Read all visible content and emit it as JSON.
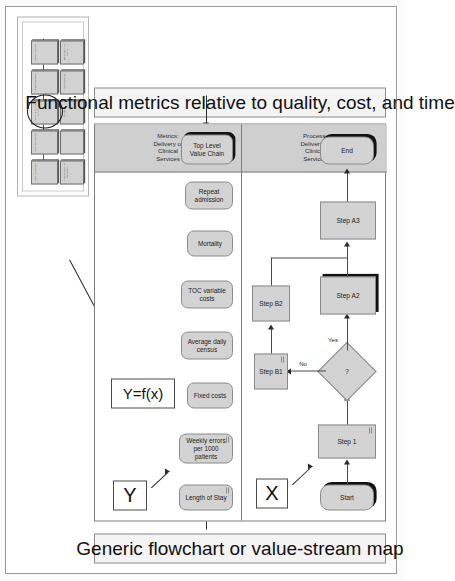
{
  "document": {
    "title": "Functional metrics relative to quality, cost, and time",
    "subtitle": "Generic flowchart or value-stream map"
  },
  "captions": {
    "metrics_caption": "Functional metrics relative to quality, cost, and time",
    "process_caption": "Generic flowchart or value-stream map"
  },
  "markers": {
    "y": "Y",
    "x": "X",
    "relation": "Y=f(x)"
  },
  "lanes": [
    {
      "id": "metrics",
      "label": "Metrics:\nDelivery of\nClinical\nServices",
      "label_lines": [
        "Metrics:",
        "Delivery of",
        "Clinical",
        "Services"
      ]
    },
    {
      "id": "process",
      "label": "Process:\nDelivery of\nClinical\nServices",
      "label_lines": [
        "Process:",
        "Delivery of",
        "Clinical",
        "Services"
      ]
    }
  ],
  "metrics": [
    {
      "id": "length-of-stay",
      "lines": [
        "Length of Stay"
      ],
      "shadow": false,
      "mark": true
    },
    {
      "id": "weekly-errors",
      "lines": [
        "Weekly errors",
        "per 1000",
        "patients"
      ],
      "shadow": false,
      "mark": true
    },
    {
      "id": "fixed-costs",
      "lines": [
        "Fixed costs"
      ],
      "shadow": false,
      "mark": false
    },
    {
      "id": "average-daily-census",
      "lines": [
        "Average daily",
        "census"
      ],
      "shadow": false,
      "mark": false
    },
    {
      "id": "toc-variable-costs",
      "lines": [
        "TOC variable",
        "costs"
      ],
      "shadow": false,
      "mark": false
    },
    {
      "id": "mortality",
      "lines": [
        "Mortality"
      ],
      "shadow": false,
      "mark": false
    },
    {
      "id": "repeat-admission",
      "lines": [
        "Repeat",
        "admission"
      ],
      "shadow": false,
      "mark": false
    },
    {
      "id": "top-level-value-chain",
      "lines": [
        "Top Level",
        "Value Chain"
      ],
      "shadow": true,
      "mark": false
    }
  ],
  "flow": {
    "nodes": [
      {
        "id": "start",
        "label": "Start",
        "shape": "terminator",
        "shadow": true
      },
      {
        "id": "step-1",
        "label": "Step 1",
        "shape": "process",
        "shadow": false
      },
      {
        "id": "decision",
        "label": "?",
        "shape": "decision",
        "shadow": false
      },
      {
        "id": "step-b1",
        "label": "Step B1",
        "shape": "process",
        "shadow": false
      },
      {
        "id": "step-b2",
        "label": "Step B2",
        "shape": "process",
        "shadow": false
      },
      {
        "id": "step-a2",
        "label": "Step A2",
        "shape": "process",
        "shadow": true
      },
      {
        "id": "step-a3",
        "label": "Step A3",
        "shape": "process",
        "shadow": false
      },
      {
        "id": "end",
        "label": "End",
        "shape": "terminator",
        "shadow": true
      }
    ],
    "edge_labels": {
      "no": "No",
      "yes": "Yes"
    }
  },
  "inset": {
    "name": "Top level value chain thumbnail",
    "highlighted_node": "Delivery of Clinical Services",
    "top_row": [
      {
        "id": "t1",
        "text": "View of the Customer"
      },
      {
        "id": "t2",
        "text": "Select and Develop"
      },
      {
        "id": "t3",
        "text": "Delivery of Clinical Services"
      },
      {
        "id": "t4",
        "text": "Manage and Collect"
      },
      {
        "id": "t5",
        "text": "Assess Financials"
      }
    ],
    "bottom_row": [
      {
        "id": "b1",
        "text": "Financial Reporting and Analysis"
      },
      {
        "id": "b2",
        "text": ""
      },
      {
        "id": "b3",
        "text": "Purchasing"
      },
      {
        "id": "b4",
        "text": "Human Resources"
      },
      {
        "id": "b5",
        "text": "Talent Acquisition Control"
      }
    ]
  },
  "colors": {
    "shape_fill": "#d3d3d3",
    "shape_stroke": "#8a8a8a",
    "lane_header_fill": "#cfcfcf",
    "shadow": "#111111",
    "banner_fill": "#f4f4f4",
    "connector": "#4a4a4a"
  }
}
